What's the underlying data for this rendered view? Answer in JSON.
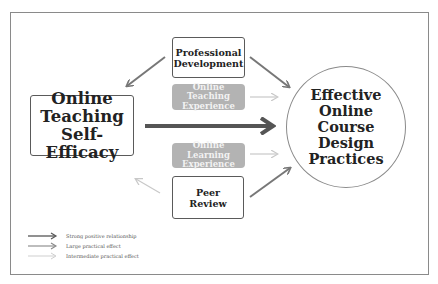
{
  "diagram": {
    "central_source": {
      "lines": [
        "Online",
        "Teaching",
        "Self-Efficacy"
      ]
    },
    "outcome": {
      "lines": [
        "Effective",
        "Online",
        "Course",
        "Design",
        "Practices"
      ]
    },
    "nodes": {
      "professional_development": {
        "lines": [
          "Professional",
          "Development"
        ]
      },
      "online_teaching_experience": {
        "lines": [
          "Online Teaching",
          "Experience"
        ]
      },
      "online_learning_experience": {
        "lines": [
          "Online Learning",
          "Experience"
        ]
      },
      "peer_review": {
        "lines": [
          "Peer",
          "Review"
        ]
      }
    },
    "edges": [
      {
        "from": "Professional Development",
        "to": "Online Teaching Self-Efficacy",
        "type": "large"
      },
      {
        "from": "Professional Development",
        "to": "Effective Online Course Design Practices",
        "type": "large"
      },
      {
        "from": "Online Teaching Experience",
        "to": "Effective Online Course Design Practices",
        "type": "intermediate"
      },
      {
        "from": "Online Teaching Self-Efficacy",
        "to": "Effective Online Course Design Practices",
        "type": "strong"
      },
      {
        "from": "Online Learning Experience",
        "to": "Effective Online Course Design Practices",
        "type": "intermediate"
      },
      {
        "from": "Peer Review",
        "to": "Online Teaching Self-Efficacy",
        "type": "intermediate"
      },
      {
        "from": "Peer Review",
        "to": "Effective Online Course Design Practices",
        "type": "large"
      }
    ],
    "colors": {
      "strong": "#555555",
      "large": "#777777",
      "intermediate": "#c8c8c8",
      "pill_fill": "#b3b3b3",
      "border": "#8a8a8a"
    }
  },
  "legend": {
    "items": [
      {
        "label": "Strong positive relationship",
        "type": "strong"
      },
      {
        "label": "Large practical effect",
        "type": "large"
      },
      {
        "label": "Intermediate practical effect",
        "type": "intermediate"
      }
    ]
  }
}
